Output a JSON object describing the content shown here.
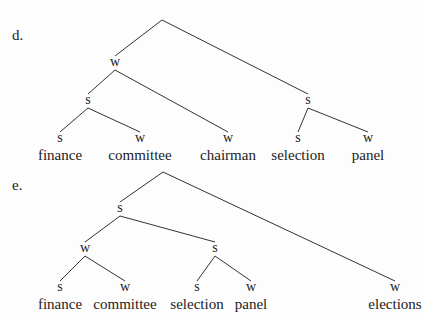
{
  "trees": [
    {
      "label": "d.",
      "nodes": [
        {
          "id": "root",
          "text": ""
        },
        {
          "id": "n1",
          "text": "w"
        },
        {
          "id": "n2",
          "text": "s"
        },
        {
          "id": "n3",
          "text": "s",
          "word": "finance"
        },
        {
          "id": "n4",
          "text": "w",
          "word": "committee"
        },
        {
          "id": "n5",
          "text": "w",
          "word": "chairman"
        },
        {
          "id": "n6",
          "text": "s"
        },
        {
          "id": "n7",
          "text": "s",
          "word": "selection"
        },
        {
          "id": "n8",
          "text": "w",
          "word": "panel"
        }
      ],
      "edges": [
        [
          "root",
          "n1"
        ],
        [
          "root",
          "n6"
        ],
        [
          "n1",
          "n2"
        ],
        [
          "n1",
          "n5"
        ],
        [
          "n2",
          "n3"
        ],
        [
          "n2",
          "n4"
        ],
        [
          "n6",
          "n7"
        ],
        [
          "n6",
          "n8"
        ]
      ]
    },
    {
      "label": "e.",
      "nodes": [
        {
          "id": "root",
          "text": ""
        },
        {
          "id": "n1",
          "text": "s"
        },
        {
          "id": "n2",
          "text": "w"
        },
        {
          "id": "n3",
          "text": "s",
          "word": "finance"
        },
        {
          "id": "n4",
          "text": "w",
          "word": "committee"
        },
        {
          "id": "n5",
          "text": "s"
        },
        {
          "id": "n6",
          "text": "s",
          "word": "selection"
        },
        {
          "id": "n7",
          "text": "w",
          "word": "panel"
        },
        {
          "id": "n8",
          "text": "w",
          "word": "elections"
        }
      ],
      "edges": [
        [
          "root",
          "n1"
        ],
        [
          "root",
          "n8"
        ],
        [
          "n1",
          "n2"
        ],
        [
          "n1",
          "n5"
        ],
        [
          "n2",
          "n3"
        ],
        [
          "n2",
          "n4"
        ],
        [
          "n5",
          "n6"
        ],
        [
          "n5",
          "n7"
        ]
      ]
    }
  ]
}
